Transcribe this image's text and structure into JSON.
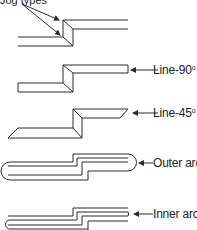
{
  "caption": {
    "text": "Jog types"
  },
  "diagrams": [
    {
      "id": "jog-basic",
      "label": "",
      "degree_sup": ""
    },
    {
      "id": "line-90",
      "label": "Line-90",
      "degree_sup": "o"
    },
    {
      "id": "line-45",
      "label": "Line-45",
      "degree_sup": "o"
    },
    {
      "id": "outer-arc",
      "label": "Outer arc",
      "degree_sup": ""
    },
    {
      "id": "inner-arc",
      "label": "Inner arc",
      "degree_sup": ""
    }
  ],
  "colors": {
    "stroke": "#2a2a2a",
    "background": "#ffffff"
  }
}
